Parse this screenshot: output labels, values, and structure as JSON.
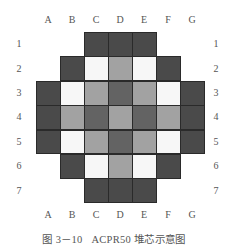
{
  "diagram": {
    "columns": [
      "A",
      "B",
      "C",
      "D",
      "E",
      "F",
      "G"
    ],
    "rows": [
      "1",
      "2",
      "3",
      "4",
      "5",
      "6",
      "7"
    ],
    "colors": {
      "edge": "#4a4a4a",
      "dark": "#636363",
      "medium": "#a2a2a2",
      "light": "#f7f7f7",
      "empty": null
    },
    "grid": [
      [
        "empty",
        "empty",
        "edge",
        "edge",
        "edge",
        "empty",
        "empty"
      ],
      [
        "empty",
        "edge",
        "light",
        "medium",
        "light",
        "edge",
        "empty"
      ],
      [
        "edge",
        "light",
        "medium",
        "dark",
        "medium",
        "light",
        "edge"
      ],
      [
        "edge",
        "medium",
        "dark",
        "medium",
        "dark",
        "medium",
        "edge"
      ],
      [
        "edge",
        "light",
        "medium",
        "dark",
        "medium",
        "light",
        "edge"
      ],
      [
        "empty",
        "edge",
        "light",
        "medium",
        "light",
        "edge",
        "empty"
      ],
      [
        "empty",
        "empty",
        "edge",
        "edge",
        "edge",
        "empty",
        "empty"
      ]
    ],
    "caption": "图 3－10   ACPR50 堆芯示意图"
  }
}
